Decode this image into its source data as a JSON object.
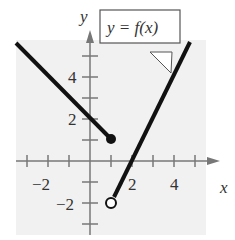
{
  "chart_data": {
    "type": "line",
    "title": "y = f(x)",
    "xlabel": "x",
    "ylabel": "y",
    "xlim": [
      -3.5,
      5.5
    ],
    "ylim": [
      -3,
      6
    ],
    "xticks": [
      -3,
      -2,
      -1,
      1,
      2,
      3,
      4,
      5
    ],
    "yticks": [
      -3,
      -2,
      -1,
      1,
      2,
      3,
      4,
      5
    ],
    "xtick_labels": [
      "-2",
      "2",
      "4"
    ],
    "ytick_labels": [
      "-2",
      "2",
      "4"
    ],
    "series": [
      {
        "name": "left piece",
        "equation": "y = -x + 2, x <= 1",
        "x": [
          -3.5,
          1
        ],
        "values": [
          5.5,
          1
        ],
        "endpoint": "closed"
      },
      {
        "name": "right piece",
        "equation": "y = 2x - 4, x > 1",
        "x": [
          1,
          4.8
        ],
        "values": [
          -2,
          5.6
        ],
        "endpoint": "open"
      }
    ],
    "grid": false,
    "annotation": "y = f(x)"
  },
  "labels": {
    "x": "x",
    "y": "y",
    "title": "y = f(x)",
    "xm2": "−2",
    "x2": "2",
    "x4": "4",
    "ym2": "−2",
    "y2": "2",
    "y4": "4"
  }
}
